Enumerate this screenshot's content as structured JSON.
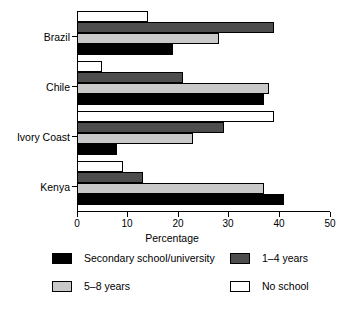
{
  "chart_data": {
    "type": "bar",
    "orientation": "horizontal",
    "title": "",
    "xlabel": "Percentage",
    "ylabel": "",
    "xlim": [
      0,
      50
    ],
    "xticks": [
      0,
      10,
      20,
      30,
      40,
      50
    ],
    "grid": false,
    "legend_position": "bottom",
    "categories": [
      "Brazil",
      "Chile",
      "Ivory Coast",
      "Kenya"
    ],
    "series": [
      {
        "name": "Secondary school/university",
        "color": "#000000",
        "values": [
          19,
          37,
          8,
          41
        ]
      },
      {
        "name": "5–8 years",
        "color": "#c9c9c9",
        "values": [
          28,
          38,
          23,
          37
        ]
      },
      {
        "name": "1–4 years",
        "color": "#4d4d4d",
        "values": [
          39,
          21,
          29,
          13
        ]
      },
      {
        "name": "No school",
        "color": "#ffffff",
        "values": [
          14,
          5,
          39,
          9
        ]
      }
    ]
  },
  "axis": {
    "x_label": "Percentage",
    "x_tick_labels": [
      "0",
      "10",
      "20",
      "30",
      "40",
      "50"
    ],
    "y_tick_labels": [
      "Brazil",
      "Chile",
      "Ivory Coast",
      "Kenya"
    ]
  },
  "legend": {
    "items": [
      {
        "label": "Secondary school/university",
        "swatch": "sw-secondary"
      },
      {
        "label": "1–4 years",
        "swatch": "sw-1-4"
      },
      {
        "label": "5–8 years",
        "swatch": "sw-5-8"
      },
      {
        "label": "No school",
        "swatch": "sw-noschool"
      }
    ]
  }
}
